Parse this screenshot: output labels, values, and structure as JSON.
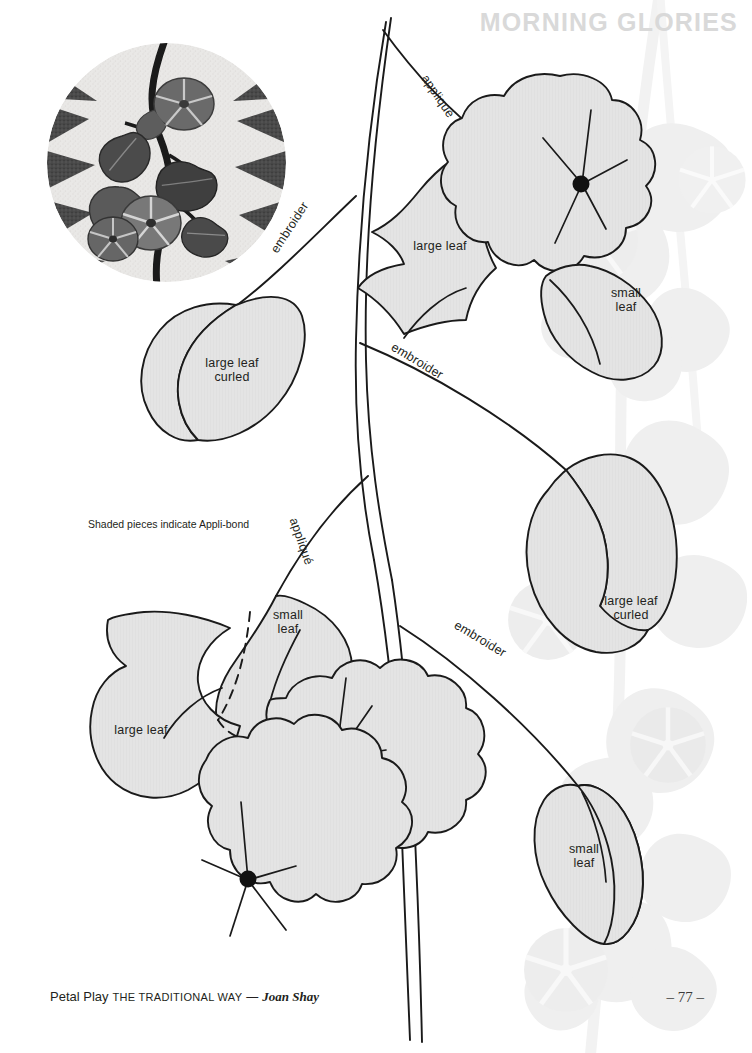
{
  "header": {
    "title": "MORNING GLORIES"
  },
  "note": {
    "text": "Shaded pieces indicate Appli-bond"
  },
  "footer": {
    "book": "Petal Play",
    "subtitle": "THE TRADITIONAL WAY",
    "dash": "—",
    "author": "Joan Shay"
  },
  "page_number": "– 77 –",
  "photo": {
    "caption": "morning-glory-applique-quilt-photo"
  },
  "colors": {
    "shaded_fill": "#e3e3e3",
    "outline": "#1a1a1a",
    "header_gray": "#d9d9d9",
    "watermark": "#f0f0f0",
    "text": "#231f20",
    "page": "#ffffff"
  },
  "pieces": [
    {
      "id": "p1",
      "label": "large leaf",
      "x": 440,
      "y": 252
    },
    {
      "id": "p2",
      "label": "small\nleaf",
      "x": 628,
      "y": 298
    },
    {
      "id": "p3",
      "label": "large leaf\ncurled",
      "x": 232,
      "y": 365
    },
    {
      "id": "p4",
      "label": "large leaf\ncurled",
      "x": 631,
      "y": 602
    },
    {
      "id": "p5",
      "label": "small\nleaf",
      "x": 583,
      "y": 848
    },
    {
      "id": "p6",
      "label": "large leaf",
      "x": 140,
      "y": 730
    },
    {
      "id": "p7",
      "label": "small\nleaf",
      "x": 288,
      "y": 616
    }
  ],
  "techniques": [
    {
      "id": "t1",
      "label": "appliqué",
      "x": 430,
      "y": 72,
      "rotate": 56
    },
    {
      "id": "t2",
      "label": "embroider",
      "x": 268,
      "y": 215,
      "rotate": -57
    },
    {
      "id": "t3",
      "label": "embroider",
      "x": 396,
      "y": 340,
      "rotate": 31
    },
    {
      "id": "t4",
      "label": "appliqué",
      "x": 302,
      "y": 515,
      "rotate": 70
    },
    {
      "id": "t5",
      "label": "embroider",
      "x": 459,
      "y": 618,
      "rotate": 31
    }
  ]
}
